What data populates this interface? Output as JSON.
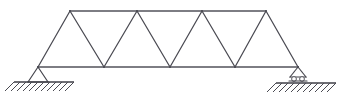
{
  "figure": {
    "type": "structural-engineering-line-diagram",
    "caption": "",
    "background_color": "#ffffff",
    "line_color": "#4a4a52",
    "canvas": {
      "width": 338,
      "height": 102
    }
  },
  "geometry": {
    "top_chord": {
      "y": 11,
      "x_start": 70,
      "x_end": 266,
      "nodes": [
        {
          "label": "U1",
          "x": 70,
          "y": 11
        },
        {
          "label": "U2",
          "x": 137,
          "y": 11
        },
        {
          "label": "U3",
          "x": 202,
          "y": 11
        },
        {
          "label": "U4",
          "x": 266,
          "y": 11
        }
      ]
    },
    "bottom_chord": {
      "y": 67,
      "x_start": 38,
      "x_end": 298,
      "nodes": [
        {
          "label": "L0",
          "x": 38,
          "y": 67
        },
        {
          "label": "L1",
          "x": 104,
          "y": 67
        },
        {
          "label": "L2",
          "x": 170,
          "y": 67
        },
        {
          "label": "L3",
          "x": 235,
          "y": 67
        },
        {
          "label": "L4",
          "x": 298,
          "y": 67
        }
      ]
    },
    "diagonals": [
      {
        "from": "L0",
        "to": "U1",
        "x1": 38,
        "y1": 67,
        "x2": 70,
        "y2": 11
      },
      {
        "from": "U1",
        "to": "L1",
        "x1": 70,
        "y1": 11,
        "x2": 104,
        "y2": 67
      },
      {
        "from": "L1",
        "to": "U2",
        "x1": 104,
        "y1": 67,
        "x2": 137,
        "y2": 11
      },
      {
        "from": "U2",
        "to": "L2",
        "x1": 137,
        "y1": 11,
        "x2": 170,
        "y2": 67
      },
      {
        "from": "L2",
        "to": "U3",
        "x1": 170,
        "y1": 67,
        "x2": 202,
        "y2": 11
      },
      {
        "from": "U3",
        "to": "L3",
        "x1": 202,
        "y1": 11,
        "x2": 235,
        "y2": 67
      },
      {
        "from": "L3",
        "to": "U4",
        "x1": 235,
        "y1": 67,
        "x2": 266,
        "y2": 11
      },
      {
        "from": "U4",
        "to": "L4",
        "x1": 266,
        "y1": 11,
        "x2": 298,
        "y2": 67
      }
    ],
    "panel_count": 8,
    "top_panel_count": 3,
    "bottom_panel_count": 4
  },
  "supports": {
    "left": {
      "kind": "pin-support",
      "apex_x": 38,
      "apex_y": 67,
      "base_y": 82,
      "base_left_x": 28,
      "base_right_x": 48,
      "ground": {
        "y": 82,
        "x_start": 14,
        "x_end": 74,
        "hatch_count": 10,
        "hatch_length": 9,
        "hatch_angle_deg": 45
      }
    },
    "right": {
      "kind": "roller-support",
      "apex_x": 298,
      "apex_y": 67,
      "base_y": 77,
      "base_left_x": 290,
      "base_right_x": 306,
      "roller_count": 2,
      "roller_radius": 2.4,
      "roller_y": 79,
      "plate_y": 81,
      "ground": {
        "y": 83,
        "x_start": 276,
        "x_end": 336,
        "hatch_count": 10,
        "hatch_length": 9,
        "hatch_angle_deg": 45
      }
    }
  },
  "labels": {
    "left_support_name": "pin-support-left",
    "right_support_name": "roller-support-right",
    "top_chord_name": "top-chord",
    "bottom_chord_name": "bottom-chord"
  }
}
